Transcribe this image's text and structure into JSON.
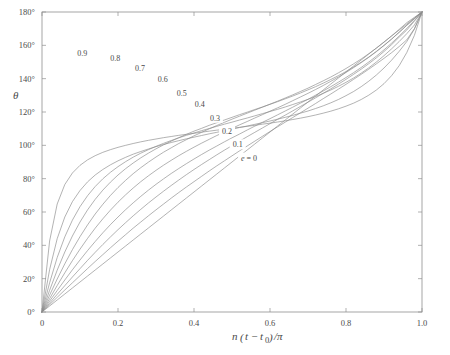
{
  "figure": {
    "background_color": "#ffffff",
    "line_color": "#8a8a8a",
    "axis_color": "#8f8f8f",
    "text_color": "#4a4a4a"
  },
  "chart_data": {
    "type": "line",
    "title": "",
    "xlabel": "n(t − t₀)/π",
    "xlabel_parts": {
      "n": "n",
      "open_paren": "(",
      "t": "t",
      "minus": "−",
      "t0": "t",
      "sub0": "0",
      "close_paren": ")",
      "slash_pi": "/π"
    },
    "ylabel": "θ",
    "xlim": [
      0,
      1.0
    ],
    "ylim": [
      0,
      180
    ],
    "grid": false,
    "legend": "inline-curve-labels",
    "xticks": [
      0,
      0.2,
      0.4,
      0.6,
      0.8,
      1.0
    ],
    "xticklabels": [
      "0",
      "0.2",
      "0.4",
      "0.6",
      "0.8",
      "1.0"
    ],
    "yticks": [
      0,
      20,
      40,
      60,
      80,
      100,
      120,
      140,
      160,
      180
    ],
    "yticklabels": [
      "0°",
      "20°",
      "40°",
      "60°",
      "80°",
      "100°",
      "120°",
      "140°",
      "160°",
      "180°"
    ],
    "x": [
      0,
      0.02,
      0.04,
      0.06,
      0.08,
      0.1,
      0.12,
      0.14,
      0.16,
      0.18,
      0.2,
      0.22,
      0.24,
      0.26,
      0.28,
      0.3,
      0.32,
      0.34,
      0.36,
      0.38,
      0.4,
      0.42,
      0.44,
      0.46,
      0.48,
      0.5,
      0.52,
      0.54,
      0.56,
      0.58,
      0.6,
      0.62,
      0.64,
      0.66,
      0.68,
      0.7,
      0.72,
      0.74,
      0.76,
      0.78,
      0.8,
      0.82,
      0.84,
      0.86,
      0.88,
      0.9,
      0.92,
      0.94,
      0.96,
      0.98,
      1.0
    ],
    "series": [
      {
        "name": "e = 0",
        "eccentricity": 0,
        "label": "e = 0",
        "label_x": 0.545,
        "label_y": 92,
        "values": [
          0,
          3.6,
          7.2,
          10.8,
          14.4,
          18,
          21.6,
          25.2,
          28.8,
          32.4,
          36,
          39.6,
          43.2,
          46.8,
          50.4,
          54,
          57.6,
          61.2,
          64.8,
          68.4,
          72,
          75.6,
          79.2,
          82.8,
          86.4,
          90,
          93.6,
          97.2,
          100.8,
          104.4,
          108,
          111.6,
          115.2,
          118.8,
          122.4,
          126,
          129.6,
          133.2,
          136.8,
          140.4,
          144,
          147.6,
          151.2,
          154.8,
          158.4,
          162,
          165.6,
          169.2,
          172.8,
          176.4,
          180
        ]
      },
      {
        "name": "0.1",
        "eccentricity": 0.1,
        "label": "0.1",
        "label_x": 0.515,
        "label_y": 100,
        "values": [
          0,
          4.4,
          8.8,
          13.2,
          17.5,
          21.8,
          26.1,
          30.3,
          34.4,
          38.5,
          42.5,
          46.4,
          50.3,
          54.0,
          57.7,
          61.3,
          64.8,
          68.3,
          71.7,
          75.0,
          78.2,
          81.4,
          84.6,
          87.7,
          90.7,
          93.7,
          96.7,
          99.6,
          102.5,
          105.4,
          108.3,
          111.1,
          113.9,
          116.7,
          119.5,
          122.3,
          125.1,
          128.0,
          130.8,
          133.7,
          136.6,
          139.6,
          142.6,
          145.7,
          148.9,
          152.2,
          155.6,
          159.3,
          163.3,
          170.0,
          180
        ]
      },
      {
        "name": "0.2",
        "eccentricity": 0.2,
        "label": "0.2",
        "label_x": 0.487,
        "label_y": 108,
        "values": [
          0,
          5.3,
          10.6,
          15.8,
          21.0,
          26.0,
          31.0,
          35.8,
          40.5,
          45.0,
          49.4,
          53.6,
          57.7,
          61.6,
          65.4,
          69.0,
          72.5,
          75.9,
          79.2,
          82.4,
          85.5,
          88.5,
          91.4,
          94.3,
          97.1,
          99.8,
          102.5,
          105.2,
          107.8,
          110.4,
          113.0,
          115.6,
          118.1,
          120.7,
          123.3,
          125.9,
          128.5,
          131.2,
          133.9,
          136.7,
          139.6,
          142.6,
          145.7,
          149.0,
          152.5,
          156.3,
          160.4,
          164.9,
          169.2,
          174.5,
          180
        ]
      },
      {
        "name": "0.3",
        "eccentricity": 0.3,
        "label": "0.3",
        "label_x": 0.455,
        "label_y": 116,
        "values": [
          0,
          6.5,
          12.9,
          19.2,
          25.3,
          31.2,
          36.9,
          42.3,
          47.5,
          52.4,
          57.0,
          61.4,
          65.5,
          69.4,
          73.1,
          76.6,
          79.9,
          83.1,
          86.1,
          89.0,
          91.8,
          94.5,
          97.1,
          99.6,
          102.1,
          104.5,
          106.8,
          109.2,
          111.5,
          113.8,
          116.0,
          118.3,
          120.6,
          122.9,
          125.3,
          127.6,
          130.1,
          132.6,
          135.2,
          137.9,
          140.7,
          143.6,
          146.7,
          150.0,
          153.5,
          157.3,
          161.3,
          165.6,
          170.1,
          175.0,
          180
        ]
      },
      {
        "name": "0.4",
        "eccentricity": 0.4,
        "label": "0.4",
        "label_x": 0.415,
        "label_y": 124,
        "values": [
          0,
          8.0,
          15.9,
          23.5,
          30.8,
          37.7,
          44.2,
          50.3,
          55.9,
          61.1,
          65.9,
          70.3,
          74.4,
          78.2,
          81.7,
          85.0,
          88.1,
          91.0,
          93.8,
          96.4,
          98.9,
          101.3,
          103.6,
          105.9,
          108.0,
          110.2,
          112.3,
          114.3,
          116.4,
          118.4,
          120.5,
          122.5,
          124.6,
          126.8,
          129.0,
          131.2,
          133.5,
          135.9,
          138.4,
          141.0,
          143.7,
          146.6,
          149.6,
          152.8,
          156.2,
          159.9,
          163.7,
          167.8,
          172.0,
          176.0,
          180
        ]
      },
      {
        "name": "0.5",
        "eccentricity": 0.5,
        "label": "0.5",
        "label_x": 0.368,
        "label_y": 131,
        "values": [
          0,
          10.1,
          19.8,
          28.9,
          37.4,
          45.2,
          52.3,
          58.8,
          64.6,
          69.9,
          74.7,
          79.0,
          83.0,
          86.6,
          89.9,
          93.0,
          95.9,
          98.5,
          101.1,
          103.4,
          105.7,
          107.8,
          109.9,
          111.9,
          113.8,
          115.7,
          117.5,
          119.3,
          121.1,
          122.9,
          124.7,
          126.5,
          128.4,
          130.3,
          132.3,
          134.3,
          136.5,
          138.7,
          141.0,
          143.5,
          146.1,
          148.9,
          151.8,
          155.0,
          158.3,
          161.9,
          165.7,
          169.6,
          173.6,
          176.8,
          180
        ]
      },
      {
        "name": "0.6",
        "eccentricity": 0.6,
        "label": "0.6",
        "label_x": 0.318,
        "label_y": 139,
        "values": [
          0,
          13.0,
          25.1,
          36.0,
          45.6,
          54.0,
          61.3,
          67.6,
          73.1,
          77.9,
          82.2,
          86.0,
          89.4,
          92.5,
          95.3,
          97.9,
          100.3,
          102.5,
          104.6,
          106.6,
          108.5,
          110.2,
          112.0,
          113.6,
          115.2,
          116.8,
          118.4,
          119.9,
          121.5,
          123.0,
          124.6,
          126.2,
          127.9,
          129.6,
          131.4,
          133.3,
          135.2,
          137.3,
          139.5,
          141.8,
          144.3,
          147.0,
          149.9,
          153.0,
          156.4,
          160.0,
          163.8,
          167.9,
          172.1,
          176.1,
          180
        ]
      },
      {
        "name": "0.7",
        "eccentricity": 0.7,
        "label": "0.7",
        "label_x": 0.258,
        "label_y": 146,
        "values": [
          0,
          17.5,
          32.7,
          45.1,
          55.1,
          63.2,
          69.8,
          75.3,
          79.9,
          83.8,
          87.2,
          90.2,
          92.9,
          95.3,
          97.4,
          99.4,
          101.2,
          102.9,
          104.5,
          106.0,
          107.4,
          108.8,
          110.1,
          111.4,
          112.7,
          113.9,
          115.2,
          116.4,
          117.7,
          119.0,
          120.3,
          121.6,
          123.0,
          124.5,
          126.0,
          127.6,
          129.3,
          131.2,
          133.2,
          135.4,
          137.8,
          140.4,
          143.3,
          146.5,
          150.0,
          153.8,
          157.9,
          162.3,
          167.0,
          172.2,
          180
        ]
      },
      {
        "name": "0.8",
        "eccentricity": 0.8,
        "label": "0.8",
        "label_x": 0.193,
        "label_y": 152,
        "values": [
          0,
          25.4,
          44.0,
          57.0,
          66.2,
          72.9,
          78.1,
          82.2,
          85.5,
          88.3,
          90.7,
          92.8,
          94.7,
          96.3,
          97.8,
          99.2,
          100.5,
          101.7,
          102.8,
          103.9,
          104.9,
          105.9,
          106.9,
          107.8,
          108.8,
          109.7,
          110.7,
          111.6,
          112.6,
          113.6,
          114.6,
          115.7,
          116.8,
          118.0,
          119.3,
          120.6,
          122.1,
          123.7,
          125.5,
          127.5,
          129.8,
          132.3,
          135.2,
          138.5,
          142.2,
          146.4,
          151.1,
          156.4,
          162.3,
          169.7,
          180
        ]
      },
      {
        "name": "0.9",
        "eccentricity": 0.9,
        "label": "0.9",
        "label_x": 0.106,
        "label_y": 155,
        "values": [
          0,
          42.6,
          64.8,
          76.5,
          83.4,
          88.0,
          91.3,
          93.8,
          95.8,
          97.4,
          98.8,
          100.0,
          101.1,
          102.1,
          103.0,
          103.8,
          104.6,
          105.3,
          106.0,
          106.6,
          107.2,
          107.9,
          108.5,
          109.1,
          109.6,
          110.2,
          110.8,
          111.4,
          112.0,
          112.7,
          113.3,
          114.0,
          114.7,
          115.5,
          116.3,
          117.2,
          118.2,
          119.3,
          120.5,
          121.9,
          123.5,
          125.3,
          127.5,
          130.1,
          133.2,
          137.0,
          141.8,
          147.8,
          155.7,
          166.0,
          180
        ]
      }
    ]
  }
}
